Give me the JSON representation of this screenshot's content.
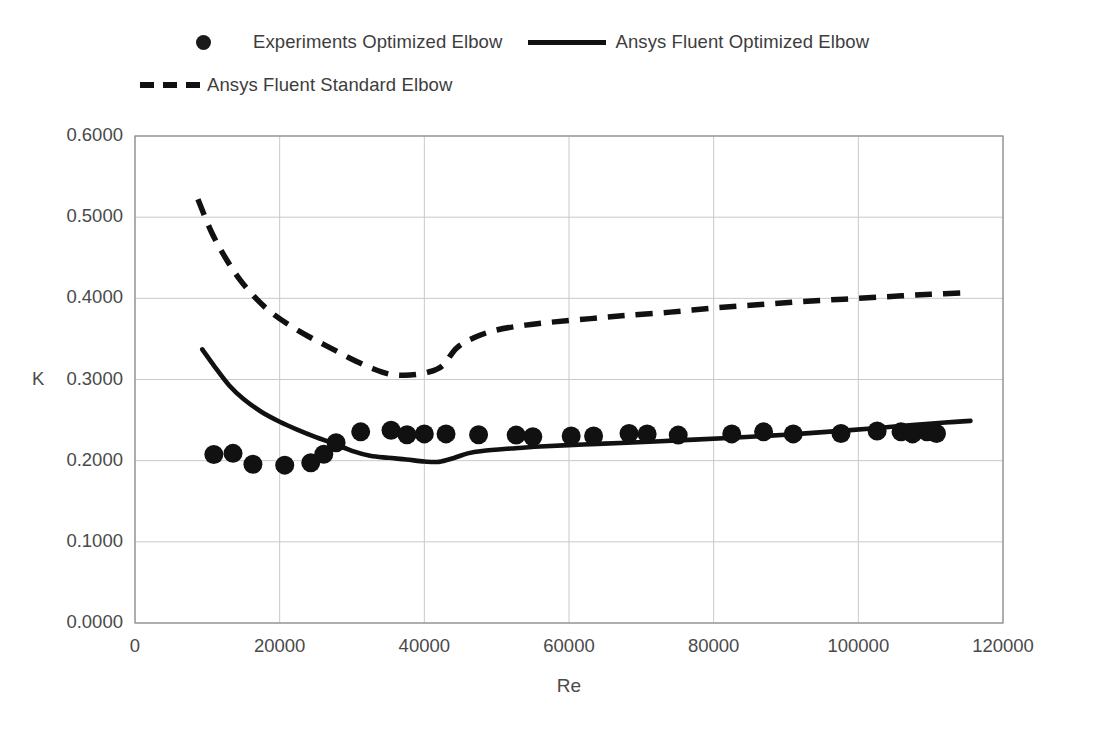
{
  "legend": {
    "entries": [
      {
        "label": "Experiments Optimized Elbow",
        "marker": "dot-marker-icon"
      },
      {
        "label": "Ansys Fluent Optimized Elbow",
        "marker": "solid-line-icon"
      },
      {
        "label": "Ansys Fluent Standard Elbow",
        "marker": "dashed-line-icon"
      }
    ]
  },
  "axes": {
    "y_title": "K",
    "x_title": "Re",
    "y_ticks": [
      "0.0000",
      "0.1000",
      "0.2000",
      "0.3000",
      "0.4000",
      "0.5000",
      "0.6000"
    ],
    "x_ticks": [
      "0",
      "20000",
      "40000",
      "60000",
      "80000",
      "100000",
      "120000"
    ]
  },
  "chart_data": {
    "type": "scatter",
    "title": "",
    "xlabel": "Re",
    "ylabel": "K",
    "xlim": [
      0,
      120000
    ],
    "ylim": [
      0.0,
      0.6
    ],
    "xticks": [
      0,
      20000,
      40000,
      60000,
      80000,
      100000,
      120000
    ],
    "yticks": [
      0.0,
      0.1,
      0.2,
      0.3,
      0.4,
      0.5,
      0.6
    ],
    "grid": true,
    "legend_position": "top",
    "colors": {
      "data": "#111111",
      "grid": "#c9c9c9",
      "axis": "#8a8a8a"
    },
    "series": [
      {
        "name": "Experiments Optimized Elbow",
        "type": "scatter",
        "marker": "filled-circle",
        "points": [
          [
            10900,
            0.2075
          ],
          [
            13550,
            0.209
          ],
          [
            16300,
            0.1955
          ],
          [
            20700,
            0.1945
          ],
          [
            24300,
            0.1975
          ],
          [
            26100,
            0.208
          ],
          [
            27800,
            0.222
          ],
          [
            31200,
            0.2355
          ],
          [
            35400,
            0.2375
          ],
          [
            37600,
            0.232
          ],
          [
            40000,
            0.233
          ],
          [
            43000,
            0.233
          ],
          [
            47500,
            0.232
          ],
          [
            52700,
            0.2315
          ],
          [
            55000,
            0.2295
          ],
          [
            60300,
            0.2305
          ],
          [
            63400,
            0.2305
          ],
          [
            68300,
            0.2335
          ],
          [
            70800,
            0.233
          ],
          [
            75100,
            0.2315
          ],
          [
            82500,
            0.233
          ],
          [
            86900,
            0.2355
          ],
          [
            91000,
            0.233
          ],
          [
            97600,
            0.2335
          ],
          [
            102600,
            0.2365
          ],
          [
            105900,
            0.2355
          ],
          [
            107500,
            0.233
          ],
          [
            109500,
            0.2355
          ],
          [
            110800,
            0.2335
          ]
        ]
      },
      {
        "name": "Ansys Fluent Optimized Elbow",
        "type": "line",
        "style": "solid",
        "points": [
          [
            9300,
            0.337
          ],
          [
            11000,
            0.316
          ],
          [
            13000,
            0.293
          ],
          [
            15000,
            0.276
          ],
          [
            17500,
            0.26
          ],
          [
            20000,
            0.248
          ],
          [
            22500,
            0.238
          ],
          [
            25000,
            0.229
          ],
          [
            27500,
            0.221
          ],
          [
            30000,
            0.212
          ],
          [
            32500,
            0.206
          ],
          [
            35000,
            0.2035
          ],
          [
            37500,
            0.2015
          ],
          [
            40000,
            0.199
          ],
          [
            42000,
            0.1985
          ],
          [
            44000,
            0.203
          ],
          [
            46000,
            0.209
          ],
          [
            48000,
            0.212
          ],
          [
            52000,
            0.215
          ],
          [
            56000,
            0.2175
          ],
          [
            62000,
            0.22
          ],
          [
            68000,
            0.222
          ],
          [
            75000,
            0.225
          ],
          [
            82000,
            0.228
          ],
          [
            90000,
            0.232
          ],
          [
            98000,
            0.237
          ],
          [
            105000,
            0.242
          ],
          [
            112000,
            0.247
          ],
          [
            115500,
            0.249
          ]
        ]
      },
      {
        "name": "Ansys Fluent Standard Elbow",
        "type": "line",
        "style": "dashed",
        "points": [
          [
            8700,
            0.522
          ],
          [
            10500,
            0.483
          ],
          [
            12500,
            0.45
          ],
          [
            14500,
            0.423
          ],
          [
            16500,
            0.402
          ],
          [
            18500,
            0.385
          ],
          [
            21000,
            0.369
          ],
          [
            24000,
            0.353
          ],
          [
            27000,
            0.339
          ],
          [
            30000,
            0.325
          ],
          [
            33000,
            0.313
          ],
          [
            35500,
            0.306
          ],
          [
            38000,
            0.3055
          ],
          [
            40500,
            0.309
          ],
          [
            42500,
            0.317
          ],
          [
            44500,
            0.339
          ],
          [
            47000,
            0.352
          ],
          [
            50000,
            0.361
          ],
          [
            54000,
            0.367
          ],
          [
            58000,
            0.371
          ],
          [
            63000,
            0.375
          ],
          [
            68000,
            0.379
          ],
          [
            74000,
            0.383
          ],
          [
            80000,
            0.388
          ],
          [
            86000,
            0.392
          ],
          [
            92000,
            0.396
          ],
          [
            98000,
            0.399
          ],
          [
            104000,
            0.402
          ],
          [
            110000,
            0.405
          ],
          [
            115500,
            0.407
          ]
        ]
      }
    ]
  }
}
